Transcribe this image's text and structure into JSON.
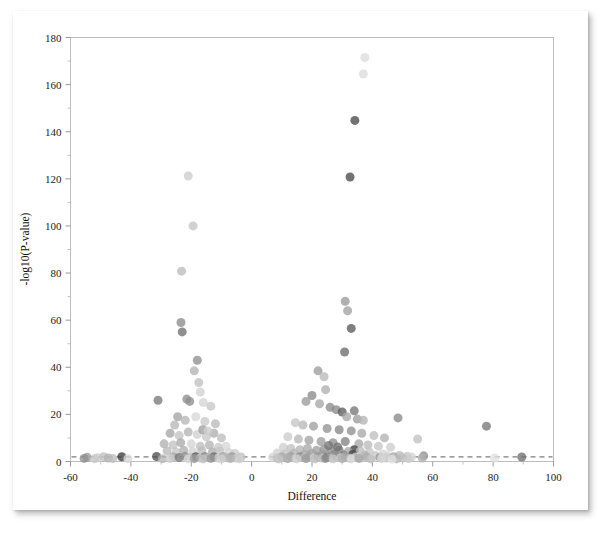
{
  "figure": {
    "background_color": "#ffffff",
    "card_color": "#ffffff",
    "frame_color": "#bdbdbd"
  },
  "chart_data": {
    "type": "scatter",
    "title": "",
    "subtitle": "",
    "xlabel": "Difference",
    "ylabel": "-log10(P-value)",
    "xlim": [
      -60,
      100
    ],
    "ylim": [
      0,
      180
    ],
    "xticks": [
      -60,
      -40,
      -20,
      0,
      20,
      40,
      60,
      80,
      100
    ],
    "xtick_labels": [
      "-60",
      "-40",
      "-20",
      "0",
      "20",
      "40",
      "60",
      "80",
      "100"
    ],
    "yticks": [
      0,
      20,
      40,
      60,
      80,
      100,
      120,
      140,
      160,
      180
    ],
    "ytick_labels": [
      "0",
      "20",
      "40",
      "60",
      "80",
      "100",
      "120",
      "140",
      "160",
      "180"
    ],
    "x_minor_step": 10,
    "y_minor_step": 10,
    "grid": false,
    "legend": null,
    "legend_position": "none",
    "annotations": [
      {
        "kind": "horizontal-threshold-line",
        "y": 2.0,
        "style": "dashed",
        "color": "#7d7d7d",
        "label": ""
      }
    ],
    "marker": {
      "shape": "circle",
      "size_px": 9,
      "opacity": 0.78,
      "color_range": [
        "#303030",
        "#e8e8e8"
      ]
    },
    "points": [
      {
        "x": 37.5,
        "y": 171.5,
        "c": "#dcdcdc"
      },
      {
        "x": 37.0,
        "y": 164.5,
        "c": "#dcdcdc"
      },
      {
        "x": 34.2,
        "y": 144.8,
        "c": "#4a4a4a"
      },
      {
        "x": 32.6,
        "y": 120.8,
        "c": "#4a4a4a"
      },
      {
        "x": -21.0,
        "y": 121.2,
        "c": "#cccccc"
      },
      {
        "x": -19.4,
        "y": 100.0,
        "c": "#c4c4c4"
      },
      {
        "x": -23.2,
        "y": 80.8,
        "c": "#bdbdbd"
      },
      {
        "x": 31.0,
        "y": 68.0,
        "c": "#9a9a9a"
      },
      {
        "x": 31.8,
        "y": 64.0,
        "c": "#a2a2a2"
      },
      {
        "x": -23.4,
        "y": 59.0,
        "c": "#8c8c8c"
      },
      {
        "x": 33.0,
        "y": 56.5,
        "c": "#5b5b5b"
      },
      {
        "x": -23.0,
        "y": 55.0,
        "c": "#707070"
      },
      {
        "x": 30.8,
        "y": 46.5,
        "c": "#6b6b6b"
      },
      {
        "x": -18.0,
        "y": 43.0,
        "c": "#8f8f8f"
      },
      {
        "x": -19.0,
        "y": 38.5,
        "c": "#b3b3b3"
      },
      {
        "x": 22.0,
        "y": 38.5,
        "c": "#9c9c9c"
      },
      {
        "x": 24.0,
        "y": 36.0,
        "c": "#b8b8b8"
      },
      {
        "x": -17.5,
        "y": 33.5,
        "c": "#c0c0c0"
      },
      {
        "x": -17.0,
        "y": 29.5,
        "c": "#d2d2d2"
      },
      {
        "x": 24.5,
        "y": 30.5,
        "c": "#b0b0b0"
      },
      {
        "x": 20.0,
        "y": 28.0,
        "c": "#8a8a8a"
      },
      {
        "x": -31.0,
        "y": 26.0,
        "c": "#7a7a7a"
      },
      {
        "x": -21.5,
        "y": 26.5,
        "c": "#909090"
      },
      {
        "x": -20.5,
        "y": 25.5,
        "c": "#8e8e8e"
      },
      {
        "x": -16.0,
        "y": 25.0,
        "c": "#d5d5d5"
      },
      {
        "x": -13.5,
        "y": 23.5,
        "c": "#c7c7c7"
      },
      {
        "x": 18.0,
        "y": 25.5,
        "c": "#9b9b9b"
      },
      {
        "x": 22.5,
        "y": 24.5,
        "c": "#a6a6a6"
      },
      {
        "x": 26.0,
        "y": 23.0,
        "c": "#8d8d8d"
      },
      {
        "x": 28.0,
        "y": 22.0,
        "c": "#8a8a8a"
      },
      {
        "x": 30.0,
        "y": 21.0,
        "c": "#5e5e5e"
      },
      {
        "x": 34.0,
        "y": 21.5,
        "c": "#777777"
      },
      {
        "x": 31.5,
        "y": 19.0,
        "c": "#a8a8a8"
      },
      {
        "x": 35.0,
        "y": 18.0,
        "c": "#9e9e9e"
      },
      {
        "x": 37.0,
        "y": 17.5,
        "c": "#b4b4b4"
      },
      {
        "x": 48.5,
        "y": 18.5,
        "c": "#8b8b8b"
      },
      {
        "x": 77.8,
        "y": 15.0,
        "c": "#787878"
      },
      {
        "x": -24.5,
        "y": 19.0,
        "c": "#a4a4a4"
      },
      {
        "x": -22.0,
        "y": 17.5,
        "c": "#b6b6b6"
      },
      {
        "x": -18.5,
        "y": 19.0,
        "c": "#d8d8d8"
      },
      {
        "x": -15.5,
        "y": 17.0,
        "c": "#c9c9c9"
      },
      {
        "x": -12.0,
        "y": 16.0,
        "c": "#bbbbbb"
      },
      {
        "x": 14.5,
        "y": 16.5,
        "c": "#c5c5c5"
      },
      {
        "x": 17.0,
        "y": 15.5,
        "c": "#b9b9b9"
      },
      {
        "x": 20.5,
        "y": 15.0,
        "c": "#a0a0a0"
      },
      {
        "x": 25.0,
        "y": 14.0,
        "c": "#949494"
      },
      {
        "x": 29.0,
        "y": 13.5,
        "c": "#868686"
      },
      {
        "x": 33.0,
        "y": 13.0,
        "c": "#909090"
      },
      {
        "x": 36.5,
        "y": 12.0,
        "c": "#a9a9a9"
      },
      {
        "x": 40.5,
        "y": 11.0,
        "c": "#bfbfbf"
      },
      {
        "x": 44.0,
        "y": 10.0,
        "c": "#b2b2b2"
      },
      {
        "x": 55.0,
        "y": 9.5,
        "c": "#c1c1c1"
      },
      {
        "x": -27.0,
        "y": 12.0,
        "c": "#a7a7a7"
      },
      {
        "x": -24.0,
        "y": 11.0,
        "c": "#c3c3c3"
      },
      {
        "x": -21.0,
        "y": 12.5,
        "c": "#b5b5b5"
      },
      {
        "x": -18.0,
        "y": 11.5,
        "c": "#d0d0d0"
      },
      {
        "x": -15.0,
        "y": 10.5,
        "c": "#c8c8c8"
      },
      {
        "x": -12.5,
        "y": 12.0,
        "c": "#aeaeae"
      },
      {
        "x": -10.0,
        "y": 10.0,
        "c": "#bcbcbc"
      },
      {
        "x": 12.0,
        "y": 10.5,
        "c": "#cacaca"
      },
      {
        "x": 15.5,
        "y": 9.5,
        "c": "#b7b7b7"
      },
      {
        "x": 19.0,
        "y": 9.0,
        "c": "#a3a3a3"
      },
      {
        "x": 23.0,
        "y": 8.5,
        "c": "#9d9d9d"
      },
      {
        "x": 27.0,
        "y": 8.0,
        "c": "#8f8f8f"
      },
      {
        "x": 31.0,
        "y": 8.5,
        "c": "#838383"
      },
      {
        "x": 35.5,
        "y": 7.5,
        "c": "#a5a5a5"
      },
      {
        "x": 38.5,
        "y": 7.0,
        "c": "#bababa"
      },
      {
        "x": 42.0,
        "y": 6.5,
        "c": "#c6c6c6"
      },
      {
        "x": 46.0,
        "y": 6.0,
        "c": "#cdcdcd"
      },
      {
        "x": 34.0,
        "y": 5.0,
        "c": "#3f3f3f"
      },
      {
        "x": -29.0,
        "y": 7.5,
        "c": "#b1b1b1"
      },
      {
        "x": -26.0,
        "y": 7.0,
        "c": "#c2c2c2"
      },
      {
        "x": -23.5,
        "y": 8.0,
        "c": "#aaaaaa"
      },
      {
        "x": -20.0,
        "y": 7.5,
        "c": "#d4d4d4"
      },
      {
        "x": -17.0,
        "y": 6.5,
        "c": "#bebebe"
      },
      {
        "x": -14.0,
        "y": 7.0,
        "c": "#b4b4b4"
      },
      {
        "x": -11.0,
        "y": 6.0,
        "c": "#c9c9c9"
      },
      {
        "x": -8.5,
        "y": 6.5,
        "c": "#d6d6d6"
      },
      {
        "x": 10.5,
        "y": 6.0,
        "c": "#cecece"
      },
      {
        "x": 13.0,
        "y": 5.5,
        "c": "#c0c0c0"
      },
      {
        "x": 16.0,
        "y": 5.0,
        "c": "#b3b3b3"
      },
      {
        "x": 18.5,
        "y": 5.5,
        "c": "#a9a9a9"
      },
      {
        "x": 21.5,
        "y": 4.8,
        "c": "#9f9f9f"
      },
      {
        "x": 24.0,
        "y": 5.2,
        "c": "#959595"
      },
      {
        "x": 26.5,
        "y": 4.5,
        "c": "#8b8b8b"
      },
      {
        "x": 29.0,
        "y": 4.8,
        "c": "#818181"
      },
      {
        "x": 32.0,
        "y": 4.2,
        "c": "#a7a7a7"
      },
      {
        "x": 36.0,
        "y": 4.5,
        "c": "#bdbdbd"
      },
      {
        "x": 39.0,
        "y": 4.0,
        "c": "#c7c7c7"
      },
      {
        "x": -28.0,
        "y": 4.5,
        "c": "#b8b8b8"
      },
      {
        "x": -25.0,
        "y": 4.0,
        "c": "#c5c5c5"
      },
      {
        "x": -22.5,
        "y": 4.8,
        "c": "#b0b0b0"
      },
      {
        "x": -19.5,
        "y": 4.2,
        "c": "#d1d1d1"
      },
      {
        "x": -16.5,
        "y": 4.6,
        "c": "#bcbcbc"
      },
      {
        "x": -13.0,
        "y": 4.0,
        "c": "#aeaeae"
      },
      {
        "x": -10.5,
        "y": 4.4,
        "c": "#c4c4c4"
      },
      {
        "x": -7.5,
        "y": 3.8,
        "c": "#d3d3d3"
      },
      {
        "x": -5.5,
        "y": 3.4,
        "c": "#cbcbcb"
      },
      {
        "x": 8.5,
        "y": 3.6,
        "c": "#d0d0d0"
      },
      {
        "x": 11.0,
        "y": 3.2,
        "c": "#c3c3c3"
      },
      {
        "x": 14.0,
        "y": 3.5,
        "c": "#b6b6b6"
      },
      {
        "x": 17.5,
        "y": 3.0,
        "c": "#ababab"
      },
      {
        "x": 20.0,
        "y": 3.3,
        "c": "#a1a1a1"
      },
      {
        "x": 23.5,
        "y": 2.9,
        "c": "#979797"
      },
      {
        "x": 27.5,
        "y": 3.2,
        "c": "#8d8d8d"
      },
      {
        "x": 30.5,
        "y": 2.8,
        "c": "#848484"
      },
      {
        "x": 33.5,
        "y": 3.0,
        "c": "#4d4d4d"
      },
      {
        "x": 37.5,
        "y": 2.7,
        "c": "#b9b9b9"
      },
      {
        "x": 41.0,
        "y": 2.5,
        "c": "#c8c8c8"
      },
      {
        "x": 45.0,
        "y": 2.3,
        "c": "#d2d2d2"
      },
      {
        "x": 49.0,
        "y": 2.6,
        "c": "#bdbdbd"
      },
      {
        "x": 51.5,
        "y": 2.2,
        "c": "#c6c6c6"
      },
      {
        "x": 57.0,
        "y": 2.4,
        "c": "#8e8e8e"
      },
      {
        "x": -54.5,
        "y": 1.8,
        "c": "#9b9b9b"
      },
      {
        "x": -51.0,
        "y": 1.6,
        "c": "#cfcfcf"
      },
      {
        "x": -49.0,
        "y": 2.0,
        "c": "#c1c1c1"
      },
      {
        "x": -47.5,
        "y": 1.5,
        "c": "#b2b2b2"
      },
      {
        "x": -43.0,
        "y": 2.0,
        "c": "#3d3d3d"
      },
      {
        "x": -31.5,
        "y": 2.1,
        "c": "#4f4f4f"
      },
      {
        "x": -26.0,
        "y": 2.0,
        "c": "#aaaaaa"
      },
      {
        "x": -24.0,
        "y": 1.7,
        "c": "#787878"
      },
      {
        "x": -22.0,
        "y": 2.2,
        "c": "#929292"
      },
      {
        "x": -20.0,
        "y": 1.6,
        "c": "#bebebe"
      },
      {
        "x": -18.5,
        "y": 2.0,
        "c": "#545454"
      },
      {
        "x": -17.0,
        "y": 1.5,
        "c": "#cacaca"
      },
      {
        "x": -15.5,
        "y": 2.1,
        "c": "#8a8a8a"
      },
      {
        "x": -14.0,
        "y": 1.6,
        "c": "#bfbfbf"
      },
      {
        "x": -12.5,
        "y": 2.0,
        "c": "#6e6e6e"
      },
      {
        "x": -11.0,
        "y": 1.5,
        "c": "#d4d4d4"
      },
      {
        "x": -9.5,
        "y": 2.1,
        "c": "#a6a6a6"
      },
      {
        "x": -8.0,
        "y": 1.6,
        "c": "#b7b7b7"
      },
      {
        "x": -6.5,
        "y": 2.0,
        "c": "#999999"
      },
      {
        "x": -5.0,
        "y": 1.4,
        "c": "#cdcdcd"
      },
      {
        "x": -3.5,
        "y": 1.9,
        "c": "#c2c2c2"
      },
      {
        "x": 7.0,
        "y": 1.8,
        "c": "#d5d5d5"
      },
      {
        "x": 8.5,
        "y": 1.4,
        "c": "#c0c0c0"
      },
      {
        "x": 10.0,
        "y": 2.0,
        "c": "#ababab"
      },
      {
        "x": 11.5,
        "y": 1.5,
        "c": "#b4b4b4"
      },
      {
        "x": 13.0,
        "y": 2.1,
        "c": "#9e9e9e"
      },
      {
        "x": 14.5,
        "y": 1.4,
        "c": "#c9c9c9"
      },
      {
        "x": 16.0,
        "y": 2.0,
        "c": "#8c8c8c"
      },
      {
        "x": 17.5,
        "y": 1.6,
        "c": "#bdbdbd"
      },
      {
        "x": 19.0,
        "y": 2.1,
        "c": "#a2a2a2"
      },
      {
        "x": 20.5,
        "y": 1.5,
        "c": "#d0d0d0"
      },
      {
        "x": 22.0,
        "y": 2.0,
        "c": "#969696"
      },
      {
        "x": 23.5,
        "y": 1.4,
        "c": "#c4c4c4"
      },
      {
        "x": 25.0,
        "y": 1.9,
        "c": "#7f7f7f"
      },
      {
        "x": 26.5,
        "y": 1.5,
        "c": "#b8b8b8"
      },
      {
        "x": 28.0,
        "y": 2.1,
        "c": "#8f8f8f"
      },
      {
        "x": 29.5,
        "y": 1.6,
        "c": "#cbcbcb"
      },
      {
        "x": 31.0,
        "y": 2.0,
        "c": "#a4a4a4"
      },
      {
        "x": 32.5,
        "y": 1.4,
        "c": "#bbbbbb"
      },
      {
        "x": 34.5,
        "y": 1.9,
        "c": "#d2d2d2"
      },
      {
        "x": 36.0,
        "y": 1.5,
        "c": "#c6c6c6"
      },
      {
        "x": 38.0,
        "y": 2.0,
        "c": "#aeaeae"
      },
      {
        "x": 40.0,
        "y": 1.4,
        "c": "#dadada"
      },
      {
        "x": 42.5,
        "y": 1.8,
        "c": "#9a9a9a"
      },
      {
        "x": 44.5,
        "y": 1.5,
        "c": "#c8c8c8"
      },
      {
        "x": 47.0,
        "y": 2.0,
        "c": "#a8a8a8"
      },
      {
        "x": 50.0,
        "y": 1.6,
        "c": "#bcbcbc"
      },
      {
        "x": 53.0,
        "y": 1.9,
        "c": "#d6d6d6"
      },
      {
        "x": 56.5,
        "y": 1.5,
        "c": "#b1b1b1"
      },
      {
        "x": 80.5,
        "y": 1.5,
        "c": "#e0e0e0"
      },
      {
        "x": 89.5,
        "y": 1.9,
        "c": "#6f6f6f"
      },
      {
        "x": -55.5,
        "y": 1.3,
        "c": "#8f8f8f"
      },
      {
        "x": -52.0,
        "y": 1.2,
        "c": "#c7c7c7"
      },
      {
        "x": -46.0,
        "y": 1.3,
        "c": "#bdbdbd"
      },
      {
        "x": -29.5,
        "y": 1.2,
        "c": "#b5b5b5"
      },
      {
        "x": -27.0,
        "y": 1.3,
        "c": "#cdcdcd"
      },
      {
        "x": -21.0,
        "y": 1.1,
        "c": "#d8d8d8"
      },
      {
        "x": -19.0,
        "y": 1.2,
        "c": "#a0a0a0"
      },
      {
        "x": -16.0,
        "y": 1.1,
        "c": "#c3c3c3"
      },
      {
        "x": -13.5,
        "y": 1.3,
        "c": "#989898"
      },
      {
        "x": -10.0,
        "y": 1.1,
        "c": "#d1d1d1"
      },
      {
        "x": -7.0,
        "y": 1.2,
        "c": "#b6b6b6"
      },
      {
        "x": -4.0,
        "y": 1.1,
        "c": "#cfcfcf"
      },
      {
        "x": 9.0,
        "y": 1.1,
        "c": "#c5c5c5"
      },
      {
        "x": 12.0,
        "y": 1.2,
        "c": "#aeaeae"
      },
      {
        "x": 15.0,
        "y": 1.1,
        "c": "#d3d3d3"
      },
      {
        "x": 18.0,
        "y": 1.2,
        "c": "#9c9c9c"
      },
      {
        "x": 21.0,
        "y": 1.1,
        "c": "#c1c1c1"
      },
      {
        "x": 24.5,
        "y": 1.3,
        "c": "#8a8a8a"
      },
      {
        "x": 27.0,
        "y": 1.1,
        "c": "#cacaca"
      },
      {
        "x": 30.0,
        "y": 1.2,
        "c": "#b0b0b0"
      },
      {
        "x": 33.0,
        "y": 1.1,
        "c": "#dcdcdc"
      },
      {
        "x": 35.5,
        "y": 1.3,
        "c": "#a7a7a7"
      },
      {
        "x": 39.5,
        "y": 1.1,
        "c": "#bfbfbf"
      },
      {
        "x": 43.0,
        "y": 1.2,
        "c": "#d7d7d7"
      },
      {
        "x": 48.0,
        "y": 1.1,
        "c": "#b9b9b9"
      },
      {
        "x": 52.0,
        "y": 1.2,
        "c": "#cccccc"
      },
      {
        "x": -41.0,
        "y": 1.2,
        "c": "#d9d9d9"
      },
      {
        "x": 25.5,
        "y": 6.8,
        "c": "#767676"
      },
      {
        "x": 28.5,
        "y": 6.2,
        "c": "#727272"
      },
      {
        "x": -16.2,
        "y": 13.5,
        "c": "#9f9f9f"
      },
      {
        "x": -14.5,
        "y": 13.0,
        "c": "#cdcdcd"
      },
      {
        "x": -25.5,
        "y": 15.5,
        "c": "#b7b7b7"
      },
      {
        "x": 43.5,
        "y": 3.2,
        "c": "#d4d4d4"
      },
      {
        "x": 46.5,
        "y": 1.0,
        "c": "#e2e2e2"
      }
    ]
  }
}
